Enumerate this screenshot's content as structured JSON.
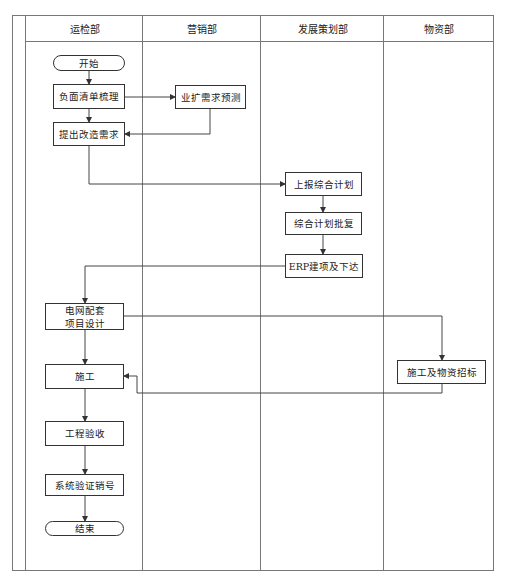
{
  "lanes": [
    {
      "label": "运检部"
    },
    {
      "label": "营销部"
    },
    {
      "label": "发展策划部"
    },
    {
      "label": "物资部"
    }
  ],
  "nodes": {
    "start": "开始",
    "negative_list": "负面清单梳理",
    "demand_forecast": "业扩需求预测",
    "raise_demand": "提出改造需求",
    "report_plan": "上报综合计划",
    "plan_approval": "综合计划批复",
    "erp_setup": "ERP建项及下达",
    "grid_design_line1": "电网配套",
    "grid_design_line2": "项目设计",
    "procurement": "施工及物资招标",
    "construction": "施工",
    "acceptance": "工程验收",
    "verify_close": "系统验证销号",
    "end": "结束"
  }
}
